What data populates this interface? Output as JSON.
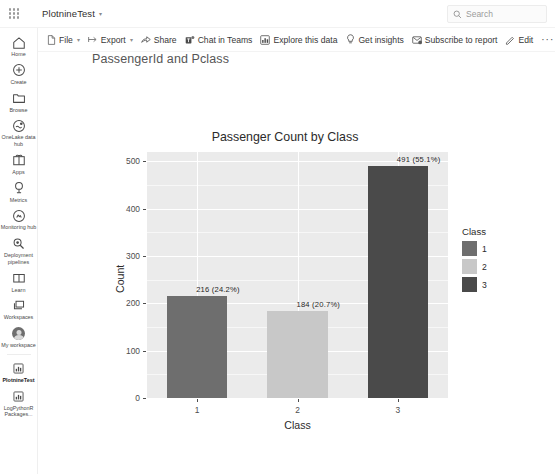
{
  "topbar": {
    "waffle_label": "app-launcher",
    "workspace_name": "PlotnineTest",
    "chevron": "▾",
    "search_placeholder": "Search",
    "search_value": ""
  },
  "toolbar": {
    "items": [
      {
        "label": "File",
        "icon": "file-icon",
        "has_chevron": true
      },
      {
        "label": "Export",
        "icon": "export-icon",
        "has_chevron": true
      },
      {
        "label": "Share",
        "icon": "share-icon",
        "has_chevron": false
      },
      {
        "label": "Chat in Teams",
        "icon": "teams-icon",
        "has_chevron": false
      },
      {
        "label": "Explore this data",
        "icon": "explore-icon",
        "has_chevron": false
      },
      {
        "label": "Get insights",
        "icon": "lightbulb-icon",
        "has_chevron": false
      },
      {
        "label": "Subscribe to report",
        "icon": "subscribe-icon",
        "has_chevron": false
      },
      {
        "label": "Edit",
        "icon": "pencil-icon",
        "has_chevron": false
      }
    ],
    "more_label": "···"
  },
  "sidebar": {
    "items": [
      {
        "label": "Home",
        "icon": "home-icon",
        "active": false
      },
      {
        "label": "Create",
        "icon": "plus-circle-icon",
        "active": false
      },
      {
        "label": "Browse",
        "icon": "folder-icon",
        "active": false
      },
      {
        "label": "OneLake data hub",
        "icon": "onelake-icon",
        "active": false
      },
      {
        "label": "Apps",
        "icon": "apps-icon",
        "active": false
      },
      {
        "label": "Metrics",
        "icon": "metrics-icon",
        "active": false
      },
      {
        "label": "Monitoring hub",
        "icon": "monitoring-icon",
        "active": false
      },
      {
        "label": "Deployment pipelines",
        "icon": "pipelines-icon",
        "active": false
      },
      {
        "label": "Learn",
        "icon": "book-icon",
        "active": false
      },
      {
        "label": "Workspaces",
        "icon": "workspaces-icon",
        "active": false
      },
      {
        "label": "My workspace",
        "icon": "avatar-icon",
        "active": false
      },
      {
        "label": "PlotnineTest",
        "icon": "report-icon",
        "active": true
      },
      {
        "label": "LogPythonR Packages...",
        "icon": "report-icon",
        "active": false
      }
    ]
  },
  "report": {
    "title": "PassengerId and Pclass"
  },
  "chart_data": {
    "type": "bar",
    "title": "Passenger Count by Class",
    "xlabel": "Class",
    "ylabel": "Count",
    "categories": [
      "1",
      "2",
      "3"
    ],
    "values": [
      216,
      184,
      491
    ],
    "percents": [
      "24.2%",
      "20.7%",
      "55.1%"
    ],
    "data_labels": [
      "216   (24.2%)",
      "184   (20.7%)",
      "491   (55.1%)"
    ],
    "bar_colors": [
      "#6e6e6e",
      "#c8c8c8",
      "#4a4a4a"
    ],
    "ylim": [
      0,
      520
    ],
    "yticks": [
      "0",
      "100",
      "200",
      "300",
      "400",
      "500"
    ],
    "ytick_values": [
      0,
      100,
      200,
      300,
      400,
      500
    ],
    "xticks": [
      "1",
      "2",
      "3"
    ],
    "grid": true,
    "panel_color": "#ebebeb",
    "legend": {
      "title": "Class",
      "position": "right",
      "entries": [
        {
          "label": "1",
          "color": "#6e6e6e"
        },
        {
          "label": "2",
          "color": "#c8c8c8"
        },
        {
          "label": "3",
          "color": "#4a4a4a"
        }
      ]
    }
  }
}
